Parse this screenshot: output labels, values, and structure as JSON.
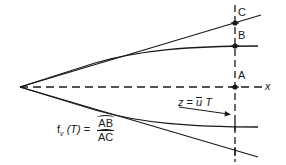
{
  "diagram": {
    "type": "plume-spread-schematic",
    "colors": {
      "stroke": "#1a1a1a",
      "background": "#ffffff"
    },
    "points": [
      {
        "id": "C",
        "label": "C"
      },
      {
        "id": "B",
        "label": "B"
      },
      {
        "id": "A",
        "label": "A"
      }
    ],
    "axis_label": "x",
    "position_label": {
      "lhs": "z",
      "eq": "=",
      "u": "u",
      "T": "T"
    },
    "formula": {
      "lhs": "f",
      "sub": "v",
      "arg": "(T)",
      "eq": "=",
      "numerator": "AB",
      "denominator": "AC"
    }
  }
}
